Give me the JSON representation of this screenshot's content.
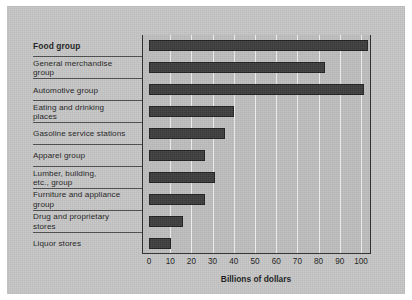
{
  "chart_data": {
    "type": "bar",
    "orientation": "horizontal",
    "title": "",
    "xlabel": "Billions of dollars",
    "ylabel": "",
    "xlim": [
      0,
      105
    ],
    "xticks": [
      0,
      10,
      20,
      30,
      40,
      50,
      60,
      70,
      80,
      90,
      100
    ],
    "grid": "vertical",
    "legend": "none",
    "categories": [
      "Food group",
      "General merchandise\ngroup",
      "Automotive group",
      "Eating and drinking\nplaces",
      "Gasoline service stations",
      "Apparel group",
      "Lumber, building,\netc., group",
      "Furniture and appliance\ngroup",
      "Drug and proprietary\nstores",
      "Liquor stores"
    ],
    "values": [
      103.5,
      83,
      101.5,
      40,
      36,
      26.5,
      31,
      26.5,
      16,
      10.5
    ],
    "series": [
      {
        "name": "Retail sales",
        "values": [
          103.5,
          83,
          101.5,
          40,
          36,
          26.5,
          31,
          26.5,
          16,
          10.5
        ]
      }
    ],
    "bar_color": "#3c3c3c",
    "plot_background": "#bdbdbd",
    "page_background": "#c5c5c5",
    "gridline_color": "#eeeeee"
  },
  "rows": [
    {
      "label": "Food group",
      "value": 103.5,
      "emphasis": "bold"
    },
    {
      "label": "General merchandise\ngroup",
      "value": 83,
      "emphasis": "normal"
    },
    {
      "label": "Automotive group",
      "value": 101.5,
      "emphasis": "normal"
    },
    {
      "label": "Eating and drinking\nplaces",
      "value": 40,
      "emphasis": "normal"
    },
    {
      "label": "Gasoline service stations",
      "value": 36,
      "emphasis": "normal"
    },
    {
      "label": "Apparel group",
      "value": 26.5,
      "emphasis": "normal"
    },
    {
      "label": "Lumber, building,\netc., group",
      "value": 31,
      "emphasis": "normal"
    },
    {
      "label": "Furniture and appliance\ngroup",
      "value": 26.5,
      "emphasis": "normal"
    },
    {
      "label": "Drug and proprietary\nstores",
      "value": 16,
      "emphasis": "normal"
    },
    {
      "label": "Liquor stores",
      "value": 10.5,
      "emphasis": "normal"
    }
  ],
  "axis": {
    "title": "Billions of dollars",
    "ticks": [
      "0",
      "10",
      "20",
      "30",
      "40",
      "50",
      "60",
      "70",
      "80",
      "90",
      "100"
    ]
  }
}
